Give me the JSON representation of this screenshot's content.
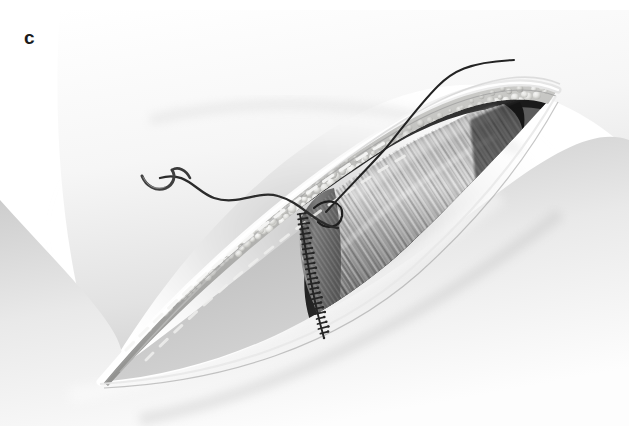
{
  "figure": {
    "panel_label": "c",
    "background_color": "#ffffff",
    "rendering": "grayscale airbrush medical illustration"
  },
  "palette": {
    "page_background": "#ffffff",
    "skin_highlight": "#fbfbfb",
    "skin_light": "#ededed",
    "skin_mid": "#cfcfcf",
    "skin_shadow": "#a8a8a8",
    "halo_shadow": "#bdbdbd",
    "fat_globule_light": "#f2f2f0",
    "fat_globule_mid": "#d8d8d4",
    "fat_bed": "#9a9a98",
    "fascia_dash": "#f4f4f2",
    "muscle_light": "#cdcdcd",
    "muscle_mid": "#8f8f8f",
    "muscle_dark": "#5a5a5a",
    "cavity_dark": "#2b2b2b",
    "cavity_black": "#121212",
    "suture_thread": "#2a2a2a",
    "needle_steel": "#4a4a4a",
    "stitch_line": "#262626"
  },
  "anatomy": {
    "layers": [
      {
        "name": "skin-surface",
        "label": "Skin surface",
        "tone": "#e6e6e6"
      },
      {
        "name": "skin-edge",
        "label": "Cut skin edge",
        "tone": "#fcfcfc"
      },
      {
        "name": "subcutaneous-fat",
        "label": "Subcutaneous fat globules",
        "tone": "#e4e4e0"
      },
      {
        "name": "fascia-incision-line",
        "label": "Dashed fascia incision marking",
        "tone": "#f4f4f2"
      },
      {
        "name": "muscle-striated",
        "label": "Striated muscle belly",
        "tone": "#8f8f8f"
      },
      {
        "name": "wound-cavity",
        "label": "Deep wound cavity",
        "tone": "#1c1c1c"
      }
    ],
    "wound": {
      "orientation": "oblique, lower-left to upper-right",
      "left_apex": {
        "x": 100,
        "y": 382
      },
      "right_apex": {
        "x": 556,
        "y": 92
      }
    }
  },
  "instruments": {
    "needle": {
      "name": "curved-surgical-needle",
      "label": "Curved surgical needle",
      "tip_position": {
        "x": 142,
        "y": 176
      },
      "color": "#4a4a4a"
    },
    "thread": {
      "name": "suture-thread",
      "label": "Suture thread",
      "color": "#2a2a2a",
      "free_end": {
        "x": 335,
        "y": 228
      },
      "exit_end": {
        "x": 515,
        "y": 62
      }
    },
    "running_suture": {
      "name": "running-fascial-suture",
      "label": "Running suture line along fascia edge",
      "stitch_count": 26,
      "color": "#262626"
    }
  }
}
